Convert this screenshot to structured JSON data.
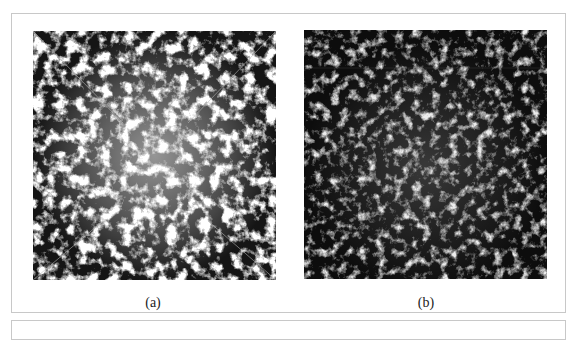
{
  "figure": {
    "panels": [
      {
        "id": "a",
        "caption": "(a)",
        "description": "dense bright filamentary particle distribution with diagonal lines from corners"
      },
      {
        "id": "b",
        "caption": "(b)",
        "description": "sparser dim filamentary particle distribution"
      }
    ],
    "colors": {
      "panel_background": "#111111",
      "frame_border": "#c8c8c8"
    }
  }
}
